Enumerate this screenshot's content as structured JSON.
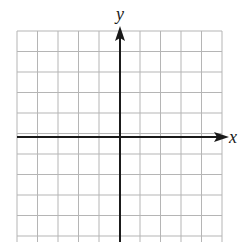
{
  "diagram": {
    "type": "coordinate-grid",
    "x_axis_label": "x",
    "y_axis_label": "y",
    "grid": {
      "columns": 10,
      "rows": 10,
      "origin_cell_col": 5,
      "origin_cell_row": 5,
      "line_color": "#b5b5b5",
      "axis_color": "#1a1a1a"
    }
  }
}
